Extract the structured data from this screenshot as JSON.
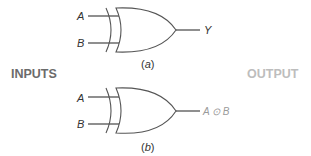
{
  "colors": {
    "line": "#555555",
    "text": "#333333",
    "inputs_heading": "#6b6b6b",
    "output_heading": "#bdbdbd",
    "output_label_b": "#9a9a9a"
  },
  "headings": {
    "inputs": "INPUTS",
    "output": "OUTPUT"
  },
  "gates": [
    {
      "id": "a",
      "type": "XOR",
      "inputs": [
        "A",
        "B"
      ],
      "output": "Y",
      "caption_open": "(",
      "caption_letter": "a",
      "caption_close": ")"
    },
    {
      "id": "b",
      "type": "XOR",
      "inputs": [
        "A",
        "B"
      ],
      "output": "A ⊙ B",
      "caption_open": "(",
      "caption_letter": "b",
      "caption_close": ")"
    }
  ]
}
